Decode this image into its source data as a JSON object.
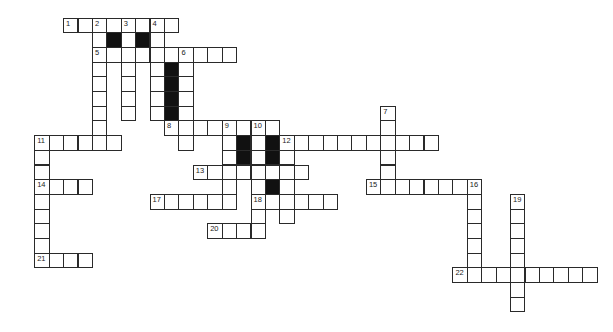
{
  "puzzle": {
    "title": "",
    "grid": {
      "origin_x": 34.2,
      "origin_y": 17.5,
      "cell_w": 14.42,
      "cell_h": 14.7,
      "note": "columns/rows indexed from left-most used column (0) and top row (0)"
    },
    "colors": {
      "line": "#2a2a2a",
      "block": "#111111",
      "cell": "#ffffff"
    },
    "cells": [
      {
        "r": 0,
        "c": 2,
        "n": "1"
      },
      {
        "r": 0,
        "c": 3
      },
      {
        "r": 0,
        "c": 4,
        "n": "2"
      },
      {
        "r": 0,
        "c": 5
      },
      {
        "r": 0,
        "c": 6,
        "n": "3"
      },
      {
        "r": 0,
        "c": 7
      },
      {
        "r": 0,
        "c": 8,
        "n": "4"
      },
      {
        "r": 0,
        "c": 9
      },
      {
        "r": 1,
        "c": 4
      },
      {
        "r": 1,
        "c": 5,
        "b": true
      },
      {
        "r": 1,
        "c": 6
      },
      {
        "r": 1,
        "c": 7,
        "b": true
      },
      {
        "r": 1,
        "c": 8
      },
      {
        "r": 2,
        "c": 4,
        "n": "5"
      },
      {
        "r": 2,
        "c": 5
      },
      {
        "r": 2,
        "c": 6
      },
      {
        "r": 2,
        "c": 7
      },
      {
        "r": 2,
        "c": 8
      },
      {
        "r": 2,
        "c": 9
      },
      {
        "r": 2,
        "c": 10,
        "n": "6"
      },
      {
        "r": 2,
        "c": 11
      },
      {
        "r": 2,
        "c": 12
      },
      {
        "r": 2,
        "c": 13
      },
      {
        "r": 3,
        "c": 4
      },
      {
        "r": 3,
        "c": 6
      },
      {
        "r": 3,
        "c": 8
      },
      {
        "r": 3,
        "c": 9,
        "b": true
      },
      {
        "r": 3,
        "c": 10
      },
      {
        "r": 4,
        "c": 4
      },
      {
        "r": 4,
        "c": 6
      },
      {
        "r": 4,
        "c": 8
      },
      {
        "r": 4,
        "c": 9,
        "b": true
      },
      {
        "r": 4,
        "c": 10
      },
      {
        "r": 5,
        "c": 4
      },
      {
        "r": 5,
        "c": 6
      },
      {
        "r": 5,
        "c": 8
      },
      {
        "r": 5,
        "c": 9,
        "b": true
      },
      {
        "r": 5,
        "c": 10
      },
      {
        "r": 6,
        "c": 4
      },
      {
        "r": 6,
        "c": 6
      },
      {
        "r": 6,
        "c": 8
      },
      {
        "r": 6,
        "c": 9,
        "b": true
      },
      {
        "r": 6,
        "c": 10
      },
      {
        "r": 6,
        "c": 24,
        "n": "7"
      },
      {
        "r": 7,
        "c": 4
      },
      {
        "r": 7,
        "c": 9,
        "n": "8"
      },
      {
        "r": 7,
        "c": 10
      },
      {
        "r": 7,
        "c": 11
      },
      {
        "r": 7,
        "c": 12
      },
      {
        "r": 7,
        "c": 13,
        "n": "9"
      },
      {
        "r": 7,
        "c": 14
      },
      {
        "r": 7,
        "c": 15,
        "n": "10"
      },
      {
        "r": 7,
        "c": 16
      },
      {
        "r": 7,
        "c": 24
      },
      {
        "r": 8,
        "c": 0,
        "n": "11"
      },
      {
        "r": 8,
        "c": 1
      },
      {
        "r": 8,
        "c": 2
      },
      {
        "r": 8,
        "c": 3
      },
      {
        "r": 8,
        "c": 4
      },
      {
        "r": 8,
        "c": 5
      },
      {
        "r": 8,
        "c": 10
      },
      {
        "r": 8,
        "c": 13
      },
      {
        "r": 8,
        "c": 14,
        "b": true
      },
      {
        "r": 8,
        "c": 15
      },
      {
        "r": 8,
        "c": 16,
        "b": true
      },
      {
        "r": 8,
        "c": 17,
        "n": "12"
      },
      {
        "r": 8,
        "c": 18
      },
      {
        "r": 8,
        "c": 19
      },
      {
        "r": 8,
        "c": 20
      },
      {
        "r": 8,
        "c": 21
      },
      {
        "r": 8,
        "c": 22
      },
      {
        "r": 8,
        "c": 23
      },
      {
        "r": 8,
        "c": 24
      },
      {
        "r": 8,
        "c": 25
      },
      {
        "r": 8,
        "c": 26
      },
      {
        "r": 8,
        "c": 27
      },
      {
        "r": 9,
        "c": 0
      },
      {
        "r": 9,
        "c": 13
      },
      {
        "r": 9,
        "c": 14,
        "b": true
      },
      {
        "r": 9,
        "c": 15
      },
      {
        "r": 9,
        "c": 16,
        "b": true
      },
      {
        "r": 9,
        "c": 17
      },
      {
        "r": 9,
        "c": 24
      },
      {
        "r": 10,
        "c": 0
      },
      {
        "r": 10,
        "c": 11,
        "n": "13"
      },
      {
        "r": 10,
        "c": 12
      },
      {
        "r": 10,
        "c": 13
      },
      {
        "r": 10,
        "c": 14
      },
      {
        "r": 10,
        "c": 15
      },
      {
        "r": 10,
        "c": 16
      },
      {
        "r": 10,
        "c": 17
      },
      {
        "r": 10,
        "c": 18
      },
      {
        "r": 10,
        "c": 24
      },
      {
        "r": 11,
        "c": 0,
        "n": "14"
      },
      {
        "r": 11,
        "c": 1
      },
      {
        "r": 11,
        "c": 2
      },
      {
        "r": 11,
        "c": 3
      },
      {
        "r": 11,
        "c": 13
      },
      {
        "r": 11,
        "c": 15
      },
      {
        "r": 11,
        "c": 16,
        "b": true
      },
      {
        "r": 11,
        "c": 17
      },
      {
        "r": 11,
        "c": 23,
        "n": "15"
      },
      {
        "r": 11,
        "c": 24
      },
      {
        "r": 11,
        "c": 25
      },
      {
        "r": 11,
        "c": 26
      },
      {
        "r": 11,
        "c": 27
      },
      {
        "r": 11,
        "c": 28
      },
      {
        "r": 11,
        "c": 29
      },
      {
        "r": 11,
        "c": 30,
        "n": "16"
      },
      {
        "r": 12,
        "c": 0
      },
      {
        "r": 12,
        "c": 8,
        "n": "17"
      },
      {
        "r": 12,
        "c": 9
      },
      {
        "r": 12,
        "c": 10
      },
      {
        "r": 12,
        "c": 11
      },
      {
        "r": 12,
        "c": 12
      },
      {
        "r": 12,
        "c": 13
      },
      {
        "r": 12,
        "c": 15,
        "n": "18"
      },
      {
        "r": 12,
        "c": 16
      },
      {
        "r": 12,
        "c": 17
      },
      {
        "r": 12,
        "c": 18
      },
      {
        "r": 12,
        "c": 19
      },
      {
        "r": 12,
        "c": 20
      },
      {
        "r": 12,
        "c": 30
      },
      {
        "r": 12,
        "c": 33,
        "n": "19"
      },
      {
        "r": 13,
        "c": 0
      },
      {
        "r": 13,
        "c": 15
      },
      {
        "r": 13,
        "c": 17
      },
      {
        "r": 13,
        "c": 30
      },
      {
        "r": 13,
        "c": 33
      },
      {
        "r": 14,
        "c": 0
      },
      {
        "r": 14,
        "c": 12,
        "n": "20"
      },
      {
        "r": 14,
        "c": 13
      },
      {
        "r": 14,
        "c": 14
      },
      {
        "r": 14,
        "c": 15
      },
      {
        "r": 14,
        "c": 30
      },
      {
        "r": 14,
        "c": 33
      },
      {
        "r": 15,
        "c": 0
      },
      {
        "r": 15,
        "c": 30
      },
      {
        "r": 15,
        "c": 33
      },
      {
        "r": 16,
        "c": 0,
        "n": "21"
      },
      {
        "r": 16,
        "c": 1
      },
      {
        "r": 16,
        "c": 2
      },
      {
        "r": 16,
        "c": 3
      },
      {
        "r": 16,
        "c": 30
      },
      {
        "r": 16,
        "c": 33
      },
      {
        "r": 17,
        "c": 29,
        "n": "22"
      },
      {
        "r": 17,
        "c": 30
      },
      {
        "r": 17,
        "c": 31
      },
      {
        "r": 17,
        "c": 32
      },
      {
        "r": 17,
        "c": 33
      },
      {
        "r": 17,
        "c": 34
      },
      {
        "r": 17,
        "c": 35
      },
      {
        "r": 17,
        "c": 36
      },
      {
        "r": 17,
        "c": 37
      },
      {
        "r": 17,
        "c": 38
      },
      {
        "r": 18,
        "c": 33
      },
      {
        "r": 19,
        "c": 33
      }
    ],
    "clue_numbers": [
      "1",
      "2",
      "3",
      "4",
      "5",
      "6",
      "7",
      "8",
      "9",
      "10",
      "11",
      "12",
      "13",
      "14",
      "15",
      "16",
      "17",
      "18",
      "19",
      "20",
      "21",
      "22"
    ]
  }
}
